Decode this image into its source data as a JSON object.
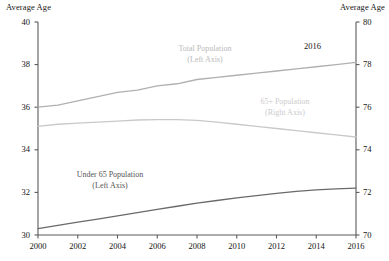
{
  "chart_data": {
    "type": "line",
    "title": "",
    "subtitle": "",
    "xlabel": "",
    "ylabel": "Average Age",
    "y2label": "Average Age",
    "grid": false,
    "legend_position": "inline-annotations",
    "x": [
      2000,
      2001,
      2002,
      2003,
      2004,
      2005,
      2006,
      2007,
      2008,
      2009,
      2010,
      2011,
      2012,
      2013,
      2014,
      2015,
      2016
    ],
    "xlim": [
      2000,
      2016
    ],
    "xticks": [
      2000,
      2002,
      2004,
      2006,
      2008,
      2010,
      2012,
      2014,
      2016
    ],
    "xtick_labels": [
      "2000",
      "2002",
      "2004",
      "2006",
      "2008",
      "2010",
      "2012",
      "2014",
      "2016"
    ],
    "ylim": [
      30,
      40
    ],
    "yticks": [
      30,
      32,
      34,
      36,
      38,
      40
    ],
    "ytick_labels": [
      "30",
      "32",
      "34",
      "36",
      "38",
      "40"
    ],
    "y2lim": [
      70,
      80
    ],
    "y2ticks": [
      70,
      72,
      74,
      76,
      78,
      80
    ],
    "y2tick_labels": [
      "70",
      "72",
      "74",
      "76",
      "78",
      "80"
    ],
    "series": [
      {
        "name": "Total Population",
        "axis": "left",
        "color": "#b0b0b0",
        "label_line1": "Total Population",
        "label_line2": "(Left Axis)",
        "values": [
          36.0,
          36.1,
          36.3,
          36.5,
          36.7,
          36.8,
          37.0,
          37.1,
          37.3,
          37.4,
          37.5,
          37.6,
          37.7,
          37.8,
          37.9,
          38.0,
          38.1
        ]
      },
      {
        "name": "65+ Population",
        "axis": "right",
        "color": "#c9c9c9",
        "label_line1": "65+ Population",
        "label_line2": "(Right Axis)",
        "values": [
          75.1,
          75.2,
          75.25,
          75.3,
          75.35,
          75.4,
          75.42,
          75.42,
          75.38,
          75.3,
          75.2,
          75.1,
          75.0,
          74.9,
          74.8,
          74.7,
          74.6
        ]
      },
      {
        "name": "Under 65 Population",
        "axis": "left",
        "color": "#6a6a6a",
        "label_line1": "Under 65 Population",
        "label_line2": "(Left Axis)",
        "values": [
          30.3,
          30.45,
          30.6,
          30.75,
          30.9,
          31.05,
          31.2,
          31.35,
          31.5,
          31.62,
          31.74,
          31.85,
          31.95,
          32.05,
          32.12,
          32.17,
          32.2
        ]
      }
    ],
    "annotations": [
      {
        "text": "2016",
        "x": 2016,
        "series": "Total Population"
      }
    ]
  },
  "axis_titles": {
    "left": "Average Age",
    "right": "Average Age"
  },
  "colors": {
    "axis": "#5a5a5a",
    "text": "#141414",
    "background": "#ffffff"
  }
}
